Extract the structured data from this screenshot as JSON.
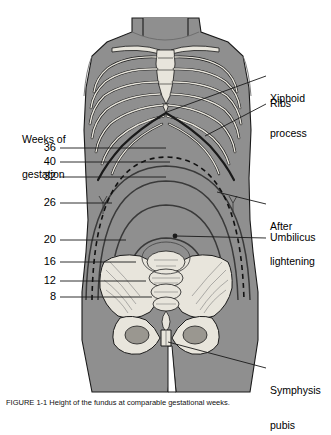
{
  "figure": {
    "kind": "medical-illustration",
    "background_color": "#ffffff",
    "body_fill": "#8f8f8f",
    "bone_fill": "#e8e5dc",
    "line_color": "#1a1a1a"
  },
  "axis_label": {
    "line1": "Weeks of",
    "line2": "gestation"
  },
  "gestation_marks": [
    {
      "weeks": "36",
      "y": 148,
      "note": "fundal height at 36 weeks (highest, pre-lightening)"
    },
    {
      "weeks": "40",
      "y": 162,
      "note": "fundal height at 40 weeks after lightening"
    },
    {
      "weeks": "32",
      "y": 177,
      "note": "fundal height at 32 weeks"
    },
    {
      "weeks": "26",
      "y": 203,
      "note": "fundal height at 26 weeks"
    },
    {
      "weeks": "20",
      "y": 240,
      "note": "fundal height at 20 weeks, level of umbilicus"
    },
    {
      "weeks": "16",
      "y": 262,
      "note": "fundal height at 16 weeks"
    },
    {
      "weeks": "12",
      "y": 281,
      "note": "fundal height at 12 weeks"
    },
    {
      "weeks": "8",
      "y": 297,
      "note": "fundal height at 8 weeks"
    }
  ],
  "annotations": [
    {
      "id": "xiphoid",
      "line1": "Xiphoid",
      "line2": "process"
    },
    {
      "id": "ribs",
      "line1": "Ribs",
      "line2": ""
    },
    {
      "id": "after-lightening",
      "line1": "After",
      "line2": "lightening"
    },
    {
      "id": "umbilicus",
      "line1": "Umbilicus",
      "line2": ""
    },
    {
      "id": "symphysis-pubis",
      "line1": "Symphysis",
      "line2": "pubis"
    }
  ],
  "caption": {
    "text": "FIGURE 1-1  Height of the fundus at comparable gestational weeks."
  }
}
